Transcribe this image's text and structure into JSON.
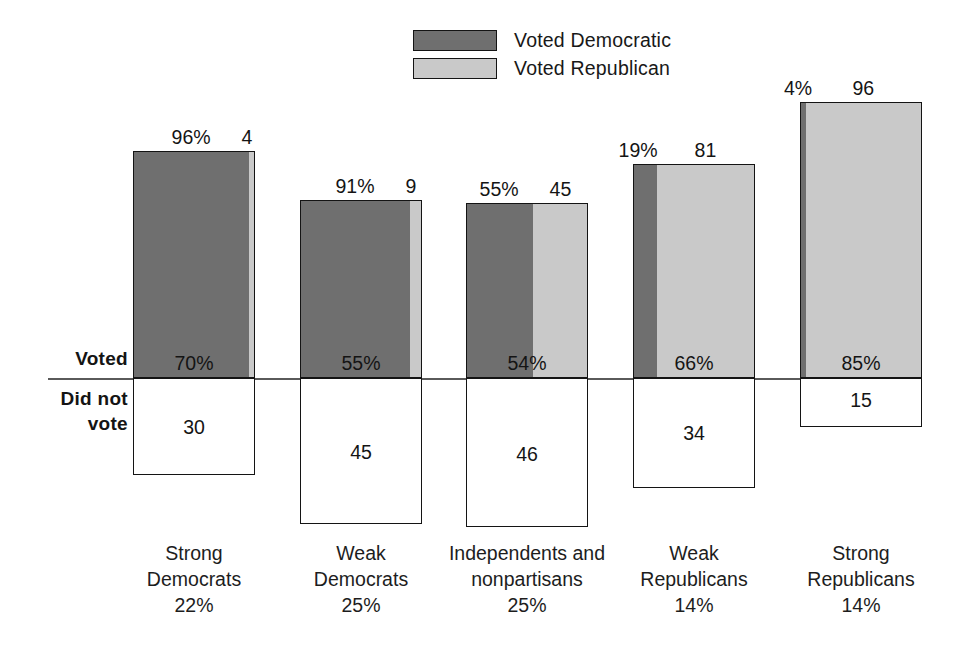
{
  "legend": {
    "items": [
      {
        "label": "Voted Democratic",
        "color": "#6f6f6f",
        "icon": "legend-swatch-dark"
      },
      {
        "label": "Voted Republican",
        "color": "#c9c9c9",
        "icon": "legend-swatch-light"
      }
    ]
  },
  "axis": {
    "voted_label": "Voted",
    "did_not_vote_line1": "Did not",
    "did_not_vote_line2": "vote"
  },
  "chart_data": {
    "type": "bar",
    "subtype": "stacked-bar-with-below-baseline-box",
    "title": "",
    "xlabel": "",
    "ylabel": "",
    "grid": false,
    "legend_position": "top-center",
    "baseline_label_above": "Voted",
    "baseline_label_below": "Did not vote",
    "categories": [
      "Strong Democrats",
      "Weak Democrats",
      "Independents and nonpartisans",
      "Weak Republicans",
      "Strong Republicans"
    ],
    "category_share_of_electorate": [
      "22%",
      "25%",
      "25%",
      "14%",
      "14%"
    ],
    "series": [
      {
        "name": "Voted Democratic",
        "values": [
          96,
          91,
          55,
          19,
          4
        ],
        "color": "#6f6f6f"
      },
      {
        "name": "Voted Republican",
        "values": [
          4,
          9,
          45,
          81,
          96
        ],
        "color": "#c9c9c9"
      },
      {
        "name": "Voted",
        "values": [
          70,
          55,
          54,
          66,
          85
        ]
      },
      {
        "name": "Did not vote",
        "values": [
          30,
          45,
          46,
          34,
          15
        ]
      }
    ]
  },
  "groups": [
    {
      "key": "strong-democrats",
      "top_left": "96%",
      "top_right": "4",
      "voted": "70%",
      "not_voted": "30",
      "dem_pct": 96,
      "rep_pct": 4,
      "voted_pct": 70,
      "not_voted_pct": 30,
      "caption_line1": "Strong",
      "caption_line2": "Democrats",
      "caption_line3": "22%"
    },
    {
      "key": "weak-democrats",
      "top_left": "91%",
      "top_right": "9",
      "voted": "55%",
      "not_voted": "45",
      "dem_pct": 91,
      "rep_pct": 9,
      "voted_pct": 55,
      "not_voted_pct": 45,
      "caption_line1": "Weak",
      "caption_line2": "Democrats",
      "caption_line3": "25%"
    },
    {
      "key": "independents-and-nonpartisans",
      "top_left": "55%",
      "top_right": "45",
      "voted": "54%",
      "not_voted": "46",
      "dem_pct": 55,
      "rep_pct": 45,
      "voted_pct": 54,
      "not_voted_pct": 46,
      "caption_line1": "Independents and",
      "caption_line2": "nonpartisans",
      "caption_line3": "25%"
    },
    {
      "key": "weak-republicans",
      "top_left": "19%",
      "top_right": "81",
      "voted": "66%",
      "not_voted": "34",
      "dem_pct": 19,
      "rep_pct": 81,
      "voted_pct": 66,
      "not_voted_pct": 34,
      "caption_line1": "Weak",
      "caption_line2": "Republicans",
      "caption_line3": "14%"
    },
    {
      "key": "strong-republicans",
      "top_left": "4%",
      "top_right": "96",
      "voted": "85%",
      "not_voted": "15",
      "dem_pct": 4,
      "rep_pct": 96,
      "voted_pct": 85,
      "not_voted_pct": 15,
      "caption_line1": "Strong",
      "caption_line2": "Republicans",
      "caption_line3": "14%"
    }
  ],
  "layout": {
    "baseline_y": 378,
    "px_per_pct": 3.245,
    "group_left_positions": [
      133,
      300,
      466,
      633,
      800
    ],
    "bar_width": 122
  }
}
